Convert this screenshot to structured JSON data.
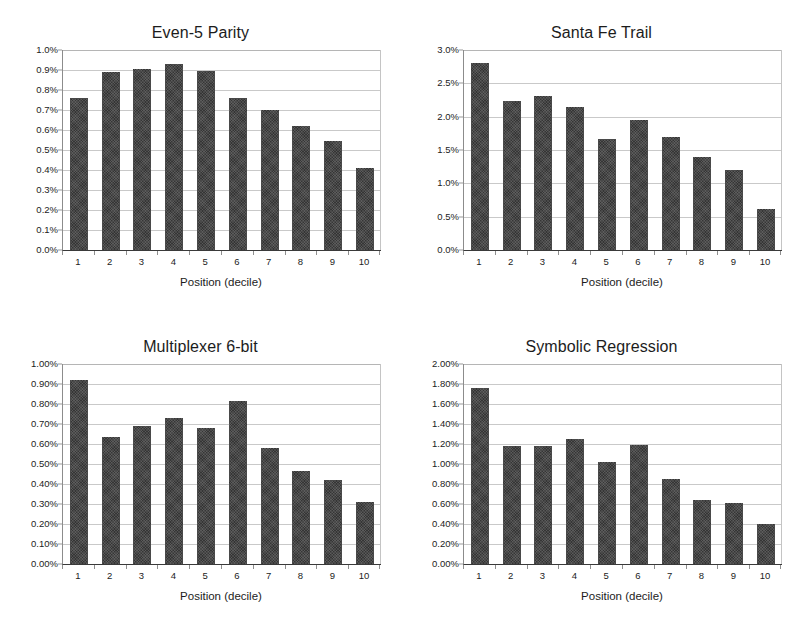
{
  "figure": {
    "background_color": "#ffffff",
    "bar_color": "#3f3f3f",
    "gridline_color": "#c9c9c9",
    "axis_color": "#3a3a3a"
  },
  "chart_data": [
    {
      "type": "bar",
      "title": "Even-5 Parity",
      "xlabel": "Position (decile)",
      "ylabel": "",
      "categories": [
        "1",
        "2",
        "3",
        "4",
        "5",
        "6",
        "7",
        "8",
        "9",
        "10"
      ],
      "values": [
        0.76,
        0.89,
        0.905,
        0.93,
        0.895,
        0.76,
        0.7,
        0.62,
        0.545,
        0.41
      ],
      "ylim": [
        0,
        1.0
      ],
      "ytick_values": [
        0.0,
        0.1,
        0.2,
        0.3,
        0.4,
        0.5,
        0.6,
        0.7,
        0.8,
        0.9,
        1.0
      ],
      "ytick_labels": [
        "0.0%",
        "0.1%",
        "0.2%",
        "0.3%",
        "0.4%",
        "0.5%",
        "0.6%",
        "0.7%",
        "0.8%",
        "0.9%",
        "1.0%"
      ],
      "grid": true,
      "legend": "none"
    },
    {
      "type": "bar",
      "title": "Santa Fe Trail",
      "xlabel": "Position (decile)",
      "ylabel": "",
      "categories": [
        "1",
        "2",
        "3",
        "4",
        "5",
        "6",
        "7",
        "8",
        "9",
        "10"
      ],
      "values": [
        2.81,
        2.24,
        2.31,
        2.14,
        1.67,
        1.95,
        1.69,
        1.39,
        1.2,
        0.62
      ],
      "ylim": [
        0,
        3.0
      ],
      "ytick_values": [
        0.0,
        0.5,
        1.0,
        1.5,
        2.0,
        2.5,
        3.0
      ],
      "ytick_labels": [
        "0.0%",
        "0.5%",
        "1.0%",
        "1.5%",
        "2.0%",
        "2.5%",
        "3.0%"
      ],
      "grid": true,
      "legend": "none"
    },
    {
      "type": "bar",
      "title": "Multiplexer 6-bit",
      "xlabel": "Position (decile)",
      "ylabel": "",
      "categories": [
        "1",
        "2",
        "3",
        "4",
        "5",
        "6",
        "7",
        "8",
        "9",
        "10"
      ],
      "values": [
        0.92,
        0.635,
        0.69,
        0.73,
        0.68,
        0.815,
        0.58,
        0.465,
        0.42,
        0.31
      ],
      "ylim": [
        0,
        1.0
      ],
      "ytick_values": [
        0.0,
        0.1,
        0.2,
        0.3,
        0.4,
        0.5,
        0.6,
        0.7,
        0.8,
        0.9,
        1.0
      ],
      "ytick_labels": [
        "0.00%",
        "0.10%",
        "0.20%",
        "0.30%",
        "0.40%",
        "0.50%",
        "0.60%",
        "0.70%",
        "0.80%",
        "0.90%",
        "1.00%"
      ],
      "grid": true,
      "legend": "none"
    },
    {
      "type": "bar",
      "title": "Symbolic Regression",
      "xlabel": "Position (decile)",
      "ylabel": "",
      "categories": [
        "1",
        "2",
        "3",
        "4",
        "5",
        "6",
        "7",
        "8",
        "9",
        "10"
      ],
      "values": [
        1.76,
        1.18,
        1.18,
        1.25,
        1.02,
        1.19,
        0.85,
        0.645,
        0.61,
        0.405
      ],
      "ylim": [
        0,
        2.0
      ],
      "ytick_values": [
        0.0,
        0.2,
        0.4,
        0.6,
        0.8,
        1.0,
        1.2,
        1.4,
        1.6,
        1.8,
        2.0
      ],
      "ytick_labels": [
        "0.00%",
        "0.20%",
        "0.40%",
        "0.60%",
        "0.80%",
        "1.00%",
        "1.20%",
        "1.40%",
        "1.60%",
        "1.80%",
        "2.00%"
      ],
      "grid": true,
      "legend": "none"
    }
  ]
}
